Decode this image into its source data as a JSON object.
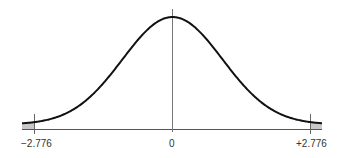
{
  "chart_data": {
    "type": "line",
    "title": "",
    "xlabel": "",
    "ylabel": "",
    "x_ticks": [
      "-2.776",
      "0",
      "+2.776"
    ],
    "critical_values": [
      -2.776,
      2.776
    ],
    "center": 0,
    "shaded_regions": [
      {
        "from": "-inf",
        "to": -2.776,
        "side": "left"
      },
      {
        "from": 2.776,
        "to": "+inf",
        "side": "right"
      }
    ],
    "grid": false,
    "legend": null,
    "colors": {
      "curve": "#111111",
      "axis": "#555555",
      "shade": "#c8c8c8"
    }
  },
  "labels": {
    "left": "−2.776",
    "center": "0",
    "right": "+2.776"
  }
}
